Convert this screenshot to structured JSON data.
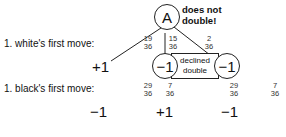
{
  "diagram": {
    "root_node": {
      "label": "A",
      "note_line1": "does not",
      "note_line2": "double!"
    },
    "row_labels": {
      "white": "1. white's first move:",
      "black": "1. black's first move:"
    },
    "white_branches": [
      {
        "num": "19",
        "den": "36",
        "outcome": "+1"
      },
      {
        "num": "15",
        "den": "36",
        "outcome": "−1"
      },
      {
        "num": "2",
        "den": "36",
        "outcome": "−1"
      }
    ],
    "declined_box": {
      "line1": "declined",
      "line2": "double"
    },
    "black_branches": [
      {
        "num": "29",
        "den": "36",
        "outcome": "−1"
      },
      {
        "num": "7",
        "den": "36",
        "outcome": "+1"
      },
      {
        "num": "29",
        "den": "36",
        "outcome": "−1"
      },
      {
        "num": "7",
        "den": "36",
        "outcome": ""
      }
    ]
  }
}
